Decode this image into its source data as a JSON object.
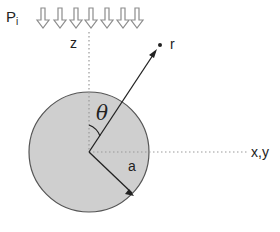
{
  "diagram": {
    "labels": {
      "pressure": "P",
      "pressure_sub": "i",
      "z_axis": "z",
      "xy_axis": "x,y",
      "point": "r",
      "angle": "θ",
      "radius": "a"
    },
    "arrows_count": 7,
    "colors": {
      "sphere_fill": "#cfcfcf",
      "sphere_stroke": "#555555",
      "arrow_stroke": "#8c8c8c",
      "line": "#222222",
      "dotted": "#9a9a9a"
    }
  }
}
